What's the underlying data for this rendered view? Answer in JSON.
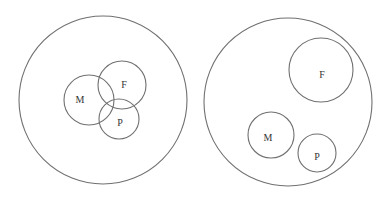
{
  "colors": {
    "stroke": "#707070",
    "text": "#333333",
    "background": "#ffffff"
  },
  "diagrams": [
    {
      "name": "overlapping",
      "universe": {
        "cx": 103,
        "cy": 100,
        "r": 84
      },
      "sets": [
        {
          "label": "M",
          "cx": 89,
          "cy": 100,
          "r": 25,
          "lx": 80,
          "ly": 99
        },
        {
          "label": "F",
          "cx": 122,
          "cy": 85,
          "r": 24,
          "lx": 124,
          "ly": 84
        },
        {
          "label": "P",
          "cx": 119,
          "cy": 119,
          "r": 20,
          "lx": 120,
          "ly": 122
        }
      ]
    },
    {
      "name": "disjoint",
      "universe": {
        "cx": 288,
        "cy": 102,
        "r": 84
      },
      "sets": [
        {
          "label": "F",
          "cx": 321,
          "cy": 70,
          "r": 32,
          "lx": 322,
          "ly": 74
        },
        {
          "label": "M",
          "cx": 271,
          "cy": 135,
          "r": 23,
          "lx": 268,
          "ly": 137
        },
        {
          "label": "P",
          "cx": 317,
          "cy": 153,
          "r": 19,
          "lx": 317,
          "ly": 156
        }
      ]
    }
  ]
}
